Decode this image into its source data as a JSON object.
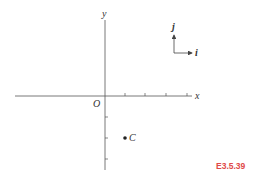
{
  "diagram": {
    "axes": {
      "x_label": "x",
      "y_label": "y",
      "origin_label": "O",
      "x_ticks": [
        1,
        2,
        3,
        4
      ],
      "y_ticks": [
        -1,
        -2,
        -3
      ]
    },
    "point": {
      "label": "C",
      "coords": [
        1,
        -2
      ]
    },
    "unit_vectors": {
      "i_label": "i",
      "j_label": "j"
    },
    "reference_label": "E3.5.39",
    "colors": {
      "axis": "#555555",
      "text": "#333333",
      "reference": "#e04848"
    }
  }
}
